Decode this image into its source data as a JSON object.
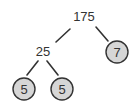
{
  "diagram": {
    "type": "factor-tree",
    "root": {
      "value": "175",
      "children": [
        {
          "value": "25",
          "children": [
            {
              "value": "5",
              "prime": true
            },
            {
              "value": "5",
              "prime": true
            }
          ]
        },
        {
          "value": "7",
          "prime": true
        }
      ]
    },
    "nodes": {
      "root": "175",
      "composite_25": "25",
      "prime_7": "7",
      "prime_5_left": "5",
      "prime_5_right": "5"
    },
    "colors": {
      "text": "#333333",
      "edge": "#333333",
      "prime_fill": "#d6d6d6",
      "prime_stroke": "#333333"
    }
  }
}
